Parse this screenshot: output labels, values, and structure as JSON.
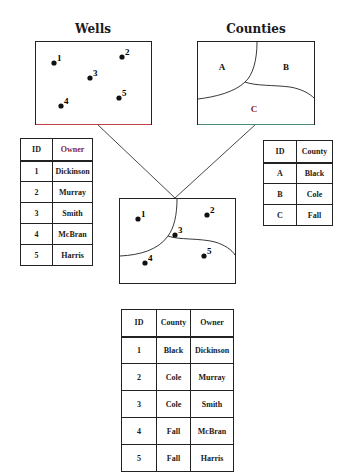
{
  "wells": {
    "title": "Wells",
    "points": [
      {
        "id": "1",
        "x": 54,
        "y": 63
      },
      {
        "id": "2",
        "x": 122,
        "y": 57
      },
      {
        "id": "3",
        "x": 90,
        "y": 78
      },
      {
        "id": "4",
        "x": 61,
        "y": 106
      },
      {
        "id": "5",
        "x": 119,
        "y": 98
      }
    ]
  },
  "counties": {
    "title": "Counties",
    "regions": [
      {
        "label": "A",
        "x": 222,
        "y": 70
      },
      {
        "label": "B",
        "x": 286,
        "y": 70
      },
      {
        "label": "C",
        "x": 254,
        "y": 112,
        "color": "#8b1a2a"
      }
    ]
  },
  "owner_table": {
    "headers": [
      "ID",
      "Owner"
    ],
    "rows": [
      [
        "1",
        "Dickinson"
      ],
      [
        "2",
        "Murray"
      ],
      [
        "3",
        "Smith"
      ],
      [
        "4",
        "McBran"
      ],
      [
        "5",
        "Harris"
      ]
    ],
    "header_owner_color": "#8b1a2a"
  },
  "county_table": {
    "headers": [
      "ID",
      "County"
    ],
    "rows": [
      [
        "A",
        "Black"
      ],
      [
        "B",
        "Cole"
      ],
      [
        "C",
        "Fall"
      ]
    ]
  },
  "overlay": {
    "points": [
      {
        "id": "1",
        "x": 138,
        "y": 219
      },
      {
        "id": "2",
        "x": 207,
        "y": 215
      },
      {
        "id": "3",
        "x": 175,
        "y": 235
      },
      {
        "id": "4",
        "x": 145,
        "y": 263
      },
      {
        "id": "5",
        "x": 204,
        "y": 256
      }
    ]
  },
  "result_table": {
    "headers": [
      "ID",
      "County",
      "Owner"
    ],
    "rows": [
      [
        "1",
        "Black",
        "Dickinson"
      ],
      [
        "2",
        "Cole",
        "Murray"
      ],
      [
        "3",
        "Cole",
        "Smith"
      ],
      [
        "4",
        "Fall",
        "McBran"
      ],
      [
        "5",
        "Fall",
        "Harris"
      ]
    ]
  }
}
